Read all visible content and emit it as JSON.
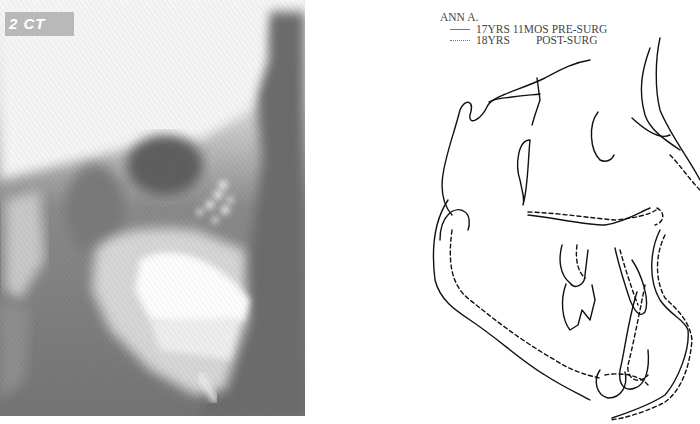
{
  "figure": {
    "left_panel": {
      "type": "lateral-cephalometric-radiograph",
      "corner_label": "2 CT"
    },
    "right_panel": {
      "type": "cephalometric-tracing-superimposition",
      "legend": {
        "title": "ANN A.",
        "entries": [
          {
            "line_style": "solid",
            "age": "17YRS 11MOS",
            "stage": "PRE-SURG"
          },
          {
            "line_style": "dotted",
            "age": "18YRS",
            "stage": "POST-SURG"
          }
        ]
      }
    },
    "colors": {
      "background": "#ffffff",
      "tracing_stroke": "#111111",
      "legend_text": "#444444",
      "xray_dark": "#6f6f6f",
      "xray_light": "#f2f2f2"
    }
  }
}
